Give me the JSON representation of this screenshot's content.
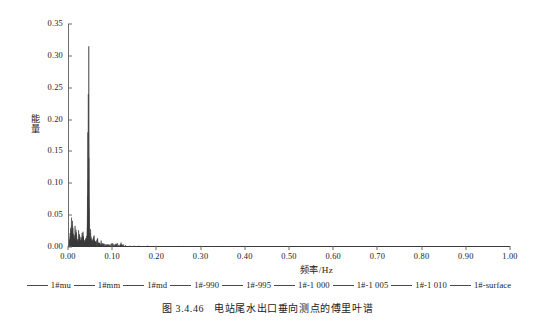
{
  "figure": {
    "caption_number": "图 3.4.46",
    "caption_text": "电站尾水出口垂向测点的傅里叶谱"
  },
  "chart_data": {
    "type": "line",
    "title": "",
    "xlabel": "频率/Hz",
    "ylabel": "能量",
    "xlim": [
      0.0,
      1.0
    ],
    "ylim": [
      0.0,
      0.35
    ],
    "xticks": [
      "0.00",
      "0.10",
      "0.20",
      "0.30",
      "0.40",
      "0.50",
      "0.60",
      "0.70",
      "0.80",
      "0.90",
      "1.00"
    ],
    "xtick_values": [
      0.0,
      0.1,
      0.2,
      0.3,
      0.4,
      0.5,
      0.6,
      0.7,
      0.8,
      0.9,
      1.0
    ],
    "yticks": [
      "0.00",
      "0.05",
      "0.10",
      "0.15",
      "0.20",
      "0.25",
      "0.30",
      "0.35"
    ],
    "ytick_values": [
      0.0,
      0.05,
      0.1,
      0.15,
      0.2,
      0.25,
      0.3,
      0.35
    ],
    "grid": false,
    "legend_position": "below-axes",
    "line_color": "#3a3a3a",
    "axis_color": "#6b6b6b",
    "series": [
      {
        "name": "1#mu",
        "peaks": [
          [
            0.0,
            0.0
          ],
          [
            0.004,
            0.012
          ],
          [
            0.008,
            0.046
          ],
          [
            0.012,
            0.02
          ],
          [
            0.016,
            0.033
          ],
          [
            0.02,
            0.01
          ],
          [
            0.024,
            0.026
          ],
          [
            0.028,
            0.008
          ],
          [
            0.032,
            0.022
          ],
          [
            0.036,
            0.009
          ],
          [
            0.04,
            0.013
          ],
          [
            0.044,
            0.031
          ],
          [
            0.047,
            0.315
          ],
          [
            0.051,
            0.028
          ],
          [
            0.055,
            0.011
          ],
          [
            0.059,
            0.018
          ],
          [
            0.063,
            0.007
          ],
          [
            0.067,
            0.014
          ],
          [
            0.071,
            0.006
          ],
          [
            0.075,
            0.01
          ],
          [
            0.08,
            0.005
          ],
          [
            0.09,
            0.004
          ],
          [
            0.1,
            0.006
          ],
          [
            0.11,
            0.005
          ],
          [
            0.12,
            0.007
          ],
          [
            0.13,
            0.003
          ],
          [
            0.15,
            0.002
          ],
          [
            0.2,
            0.001
          ],
          [
            0.4,
            0.001
          ],
          [
            0.7,
            0.0
          ],
          [
            1.0,
            0.0
          ]
        ]
      },
      {
        "name": "1#mm",
        "peaks": [
          [
            0.0,
            0.0
          ],
          [
            0.006,
            0.03
          ],
          [
            0.01,
            0.041
          ],
          [
            0.014,
            0.018
          ],
          [
            0.018,
            0.027
          ],
          [
            0.022,
            0.012
          ],
          [
            0.026,
            0.02
          ],
          [
            0.03,
            0.015
          ],
          [
            0.034,
            0.024
          ],
          [
            0.038,
            0.011
          ],
          [
            0.042,
            0.017
          ],
          [
            0.046,
            0.24
          ],
          [
            0.05,
            0.022
          ],
          [
            0.054,
            0.013
          ],
          [
            0.058,
            0.016
          ],
          [
            0.062,
            0.009
          ],
          [
            0.066,
            0.012
          ],
          [
            0.07,
            0.007
          ],
          [
            0.078,
            0.006
          ],
          [
            0.088,
            0.004
          ],
          [
            0.098,
            0.005
          ],
          [
            0.112,
            0.006
          ],
          [
            0.125,
            0.004
          ],
          [
            0.16,
            0.002
          ],
          [
            0.3,
            0.001
          ],
          [
            0.6,
            0.0
          ],
          [
            1.0,
            0.0
          ]
        ]
      },
      {
        "name": "1#md",
        "peaks": [
          [
            0.0,
            0.0
          ],
          [
            0.005,
            0.022
          ],
          [
            0.009,
            0.034
          ],
          [
            0.013,
            0.015
          ],
          [
            0.017,
            0.021
          ],
          [
            0.021,
            0.009
          ],
          [
            0.025,
            0.018
          ],
          [
            0.029,
            0.011
          ],
          [
            0.033,
            0.019
          ],
          [
            0.037,
            0.008
          ],
          [
            0.041,
            0.014
          ],
          [
            0.045,
            0.18
          ],
          [
            0.049,
            0.019
          ],
          [
            0.053,
            0.01
          ],
          [
            0.057,
            0.013
          ],
          [
            0.061,
            0.007
          ],
          [
            0.065,
            0.01
          ],
          [
            0.072,
            0.006
          ],
          [
            0.082,
            0.005
          ],
          [
            0.095,
            0.004
          ],
          [
            0.108,
            0.005
          ],
          [
            0.122,
            0.004
          ],
          [
            0.18,
            0.002
          ],
          [
            0.5,
            0.001
          ],
          [
            1.0,
            0.0
          ]
        ]
      },
      {
        "name": "1#-990",
        "peaks": [
          [
            0.0,
            0.0
          ],
          [
            0.007,
            0.026
          ],
          [
            0.011,
            0.03
          ],
          [
            0.015,
            0.013
          ],
          [
            0.019,
            0.023
          ],
          [
            0.023,
            0.01
          ],
          [
            0.027,
            0.016
          ],
          [
            0.031,
            0.012
          ],
          [
            0.035,
            0.017
          ],
          [
            0.039,
            0.009
          ],
          [
            0.043,
            0.012
          ],
          [
            0.047,
            0.14
          ],
          [
            0.052,
            0.016
          ],
          [
            0.056,
            0.009
          ],
          [
            0.06,
            0.011
          ],
          [
            0.068,
            0.007
          ],
          [
            0.076,
            0.005
          ],
          [
            0.086,
            0.004
          ],
          [
            0.102,
            0.005
          ],
          [
            0.118,
            0.004
          ],
          [
            0.14,
            0.002
          ],
          [
            0.35,
            0.001
          ],
          [
            1.0,
            0.0
          ]
        ]
      },
      {
        "name": "1#-995",
        "peaks": [
          [
            0.0,
            0.0
          ],
          [
            0.006,
            0.019
          ],
          [
            0.01,
            0.028
          ],
          [
            0.014,
            0.012
          ],
          [
            0.018,
            0.019
          ],
          [
            0.022,
            0.008
          ],
          [
            0.026,
            0.014
          ],
          [
            0.03,
            0.01
          ],
          [
            0.034,
            0.015
          ],
          [
            0.038,
            0.007
          ],
          [
            0.042,
            0.011
          ],
          [
            0.046,
            0.105
          ],
          [
            0.05,
            0.014
          ],
          [
            0.055,
            0.008
          ],
          [
            0.06,
            0.01
          ],
          [
            0.07,
            0.006
          ],
          [
            0.08,
            0.005
          ],
          [
            0.092,
            0.004
          ],
          [
            0.106,
            0.004
          ],
          [
            0.12,
            0.004
          ],
          [
            0.2,
            0.001
          ],
          [
            1.0,
            0.0
          ]
        ]
      },
      {
        "name": "1#-1 000",
        "peaks": [
          [
            0.0,
            0.0
          ],
          [
            0.005,
            0.016
          ],
          [
            0.009,
            0.024
          ],
          [
            0.013,
            0.011
          ],
          [
            0.017,
            0.016
          ],
          [
            0.021,
            0.007
          ],
          [
            0.025,
            0.013
          ],
          [
            0.029,
            0.009
          ],
          [
            0.033,
            0.013
          ],
          [
            0.037,
            0.007
          ],
          [
            0.041,
            0.01
          ],
          [
            0.045,
            0.08
          ],
          [
            0.049,
            0.012
          ],
          [
            0.054,
            0.007
          ],
          [
            0.059,
            0.009
          ],
          [
            0.069,
            0.005
          ],
          [
            0.079,
            0.004
          ],
          [
            0.094,
            0.003
          ],
          [
            0.11,
            0.004
          ],
          [
            0.124,
            0.003
          ],
          [
            0.25,
            0.001
          ],
          [
            1.0,
            0.0
          ]
        ]
      },
      {
        "name": "1#-1 005",
        "peaks": [
          [
            0.0,
            0.0
          ],
          [
            0.007,
            0.014
          ],
          [
            0.011,
            0.021
          ],
          [
            0.015,
            0.01
          ],
          [
            0.019,
            0.014
          ],
          [
            0.023,
            0.006
          ],
          [
            0.027,
            0.011
          ],
          [
            0.031,
            0.008
          ],
          [
            0.035,
            0.011
          ],
          [
            0.039,
            0.006
          ],
          [
            0.043,
            0.009
          ],
          [
            0.047,
            0.06
          ],
          [
            0.051,
            0.01
          ],
          [
            0.057,
            0.006
          ],
          [
            0.062,
            0.008
          ],
          [
            0.072,
            0.005
          ],
          [
            0.084,
            0.004
          ],
          [
            0.1,
            0.004
          ],
          [
            0.114,
            0.003
          ],
          [
            0.3,
            0.001
          ],
          [
            1.0,
            0.0
          ]
        ]
      },
      {
        "name": "1#-1 010",
        "peaks": [
          [
            0.0,
            0.0
          ],
          [
            0.006,
            0.012
          ],
          [
            0.01,
            0.018
          ],
          [
            0.014,
            0.008
          ],
          [
            0.018,
            0.012
          ],
          [
            0.022,
            0.005
          ],
          [
            0.026,
            0.009
          ],
          [
            0.03,
            0.007
          ],
          [
            0.034,
            0.01
          ],
          [
            0.038,
            0.005
          ],
          [
            0.042,
            0.008
          ],
          [
            0.046,
            0.045
          ],
          [
            0.05,
            0.009
          ],
          [
            0.056,
            0.005
          ],
          [
            0.061,
            0.007
          ],
          [
            0.074,
            0.004
          ],
          [
            0.088,
            0.003
          ],
          [
            0.104,
            0.003
          ],
          [
            0.118,
            0.003
          ],
          [
            0.4,
            0.001
          ],
          [
            1.0,
            0.0
          ]
        ]
      },
      {
        "name": "1#-surface",
        "peaks": [
          [
            0.0,
            0.0
          ],
          [
            0.005,
            0.01
          ],
          [
            0.009,
            0.015
          ],
          [
            0.013,
            0.007
          ],
          [
            0.017,
            0.01
          ],
          [
            0.021,
            0.004
          ],
          [
            0.025,
            0.008
          ],
          [
            0.029,
            0.006
          ],
          [
            0.033,
            0.008
          ],
          [
            0.037,
            0.004
          ],
          [
            0.041,
            0.007
          ],
          [
            0.045,
            0.035
          ],
          [
            0.049,
            0.008
          ],
          [
            0.055,
            0.004
          ],
          [
            0.06,
            0.006
          ],
          [
            0.076,
            0.003
          ],
          [
            0.09,
            0.003
          ],
          [
            0.108,
            0.003
          ],
          [
            0.122,
            0.002
          ],
          [
            0.5,
            0.0
          ],
          [
            1.0,
            0.0
          ]
        ]
      }
    ],
    "legend": [
      "1#mu",
      "1#mm",
      "1#md",
      "1#-990",
      "1#-995",
      "1#-1 000",
      "1#-1 005",
      "1#-1 010",
      "1#-surface"
    ],
    "annotations": [
      "dominant spectral peak at f≈0.047 Hz with energy≈0.315",
      "dense low-frequency peak cluster for f<0.09 Hz",
      "near-zero energy for f>0.15 Hz"
    ]
  }
}
